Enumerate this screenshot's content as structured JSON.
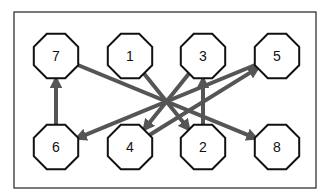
{
  "diagram": {
    "type": "directed-graph",
    "frame": {
      "x": 14,
      "y": 12,
      "width": 302,
      "height": 176
    },
    "colors": {
      "arrow": "#555555",
      "node_stroke": "#111111",
      "node_fill": "#ffffff",
      "frame": "#222222"
    },
    "nodes": [
      {
        "id": "7",
        "label": "7",
        "cx": 56,
        "cy": 56
      },
      {
        "id": "1",
        "label": "1",
        "cx": 130,
        "cy": 56
      },
      {
        "id": "3",
        "label": "3",
        "cx": 203,
        "cy": 56
      },
      {
        "id": "5",
        "label": "5",
        "cx": 277,
        "cy": 56
      },
      {
        "id": "6",
        "label": "6",
        "cx": 56,
        "cy": 147
      },
      {
        "id": "4",
        "label": "4",
        "cx": 130,
        "cy": 147
      },
      {
        "id": "2",
        "label": "2",
        "cx": 203,
        "cy": 147
      },
      {
        "id": "8",
        "label": "8",
        "cx": 277,
        "cy": 147
      }
    ],
    "edges": [
      {
        "from": "6",
        "to": "7"
      },
      {
        "from": "7",
        "to": "8"
      },
      {
        "from": "1",
        "to": "2"
      },
      {
        "from": "3",
        "to": "4"
      },
      {
        "from": "5",
        "to": "6"
      },
      {
        "from": "4",
        "to": "5"
      },
      {
        "from": "2",
        "to": "3"
      }
    ]
  }
}
